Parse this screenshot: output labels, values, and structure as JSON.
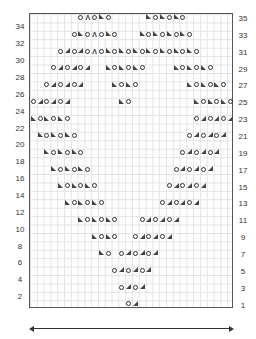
{
  "chart": {
    "columns": 30,
    "rows": 35,
    "symbols": {
      "O": "yarn-over",
      "/": "k2tog",
      "\\": "ssk",
      "K": "sk2p"
    },
    "right_labels": [
      "35",
      "33",
      "31",
      "29",
      "27",
      "25",
      "23",
      "21",
      "19",
      "17",
      "15",
      "13",
      "11",
      "9",
      "7",
      "5",
      "3",
      "1"
    ],
    "left_labels": [
      "34",
      "32",
      "30",
      "28",
      "26",
      "24",
      "22",
      "20",
      "18",
      "16",
      "14",
      "12",
      "10",
      "8",
      "6",
      "4",
      "2"
    ],
    "pattern_rows": [
      {
        "row": 35,
        "groups": [
          {
            "col": 7,
            "s": "OKO\\O"
          },
          {
            "col": 17,
            "s": "\\O\\O\\O"
          }
        ]
      },
      {
        "row": 33,
        "groups": [
          {
            "col": 6,
            "s": "O\\OKO\\O"
          },
          {
            "col": 16,
            "s": "\\O\\O\\O\\O"
          }
        ]
      },
      {
        "row": 31,
        "groups": [
          {
            "col": 4,
            "s": "O/O/OKO\\O\\O\\O\\O\\O\\O\\O"
          }
        ]
      },
      {
        "row": 29,
        "groups": [
          {
            "col": 3,
            "s": "O/O/O/"
          },
          {
            "col": 11,
            "s": "\\O\\O\\O"
          },
          {
            "col": 21,
            "s": "\\O\\O\\O"
          }
        ]
      },
      {
        "row": 27,
        "groups": [
          {
            "col": 2,
            "s": "O/O/O/"
          },
          {
            "col": 12,
            "s": "\\O\\O"
          },
          {
            "col": 23,
            "s": "\\O\\O\\O"
          }
        ]
      },
      {
        "row": 25,
        "groups": [
          {
            "col": 0,
            "s": "O/O/O/"
          },
          {
            "col": 13,
            "s": "\\O"
          },
          {
            "col": 24,
            "s": "\\O\\O\\O"
          }
        ]
      },
      {
        "row": 23,
        "groups": [
          {
            "col": 0,
            "s": "\\O\\O\\O"
          },
          {
            "col": 24,
            "s": "O/O/O/"
          }
        ]
      },
      {
        "row": 21,
        "groups": [
          {
            "col": 1,
            "s": "\\O\\O\\O"
          },
          {
            "col": 23,
            "s": "O/O/O/"
          }
        ]
      },
      {
        "row": 19,
        "groups": [
          {
            "col": 2,
            "s": "\\O\\O\\O"
          },
          {
            "col": 22,
            "s": "O/O/O/"
          }
        ]
      },
      {
        "row": 17,
        "groups": [
          {
            "col": 3,
            "s": "\\O\\O\\O"
          },
          {
            "col": 21,
            "s": "O/O/O/"
          }
        ]
      },
      {
        "row": 15,
        "groups": [
          {
            "col": 4,
            "s": "\\O\\O\\O"
          },
          {
            "col": 20,
            "s": "O/O/O/"
          }
        ]
      },
      {
        "row": 13,
        "groups": [
          {
            "col": 5,
            "s": "\\O\\O\\O"
          },
          {
            "col": 19,
            "s": "O/O/O/"
          }
        ]
      },
      {
        "row": 11,
        "groups": [
          {
            "col": 7,
            "s": "\\O\\O\\O"
          },
          {
            "col": 16,
            "s": "O/O/O/"
          }
        ]
      },
      {
        "row": 9,
        "groups": [
          {
            "col": 9,
            "s": "\\O\\O"
          },
          {
            "col": 15,
            "s": "O/O/O/"
          }
        ]
      },
      {
        "row": 7,
        "groups": [
          {
            "col": 10,
            "s": "\\O"
          },
          {
            "col": 13,
            "s": "O/O/O/"
          }
        ]
      },
      {
        "row": 5,
        "groups": [
          {
            "col": 12,
            "s": "O/O/O/"
          }
        ]
      },
      {
        "row": 3,
        "groups": [
          {
            "col": 13,
            "s": "O/O/"
          }
        ]
      },
      {
        "row": 1,
        "groups": [
          {
            "col": 14,
            "s": "O/"
          }
        ]
      }
    ]
  },
  "width_arrow": {
    "direction": "both"
  }
}
